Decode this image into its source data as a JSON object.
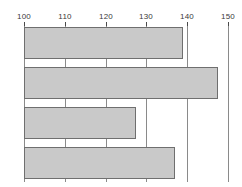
{
  "chart_data": {
    "type": "bar",
    "orientation": "horizontal",
    "title": "",
    "xlabel": "",
    "ylabel": "",
    "categories": [
      "1",
      "2",
      "3",
      "4"
    ],
    "values": [
      139,
      147.5,
      127.5,
      137
    ],
    "xlim": [
      100,
      150
    ],
    "xticks": [
      100,
      110,
      120,
      130,
      140,
      150
    ],
    "xtick_labels": [
      "100",
      "110",
      "120",
      "130",
      "140",
      "150"
    ],
    "grid": true,
    "grid_axis": "x",
    "legend": null,
    "legend_position": "none",
    "bar_fill_color": "#c9c9c9",
    "bar_border_color": "#6f6f6f",
    "gridline_color": "#8a8a8a",
    "tick_label_color": "#3a3a3a",
    "background_color": "#ffffff",
    "axis_position": "top",
    "bars": [
      {
        "category": "1",
        "value": 139,
        "label": ""
      },
      {
        "category": "2",
        "value": 147.5,
        "label": ""
      },
      {
        "category": "3",
        "value": 127.5,
        "label": ""
      },
      {
        "category": "4",
        "value": 137,
        "label": ""
      }
    ]
  }
}
